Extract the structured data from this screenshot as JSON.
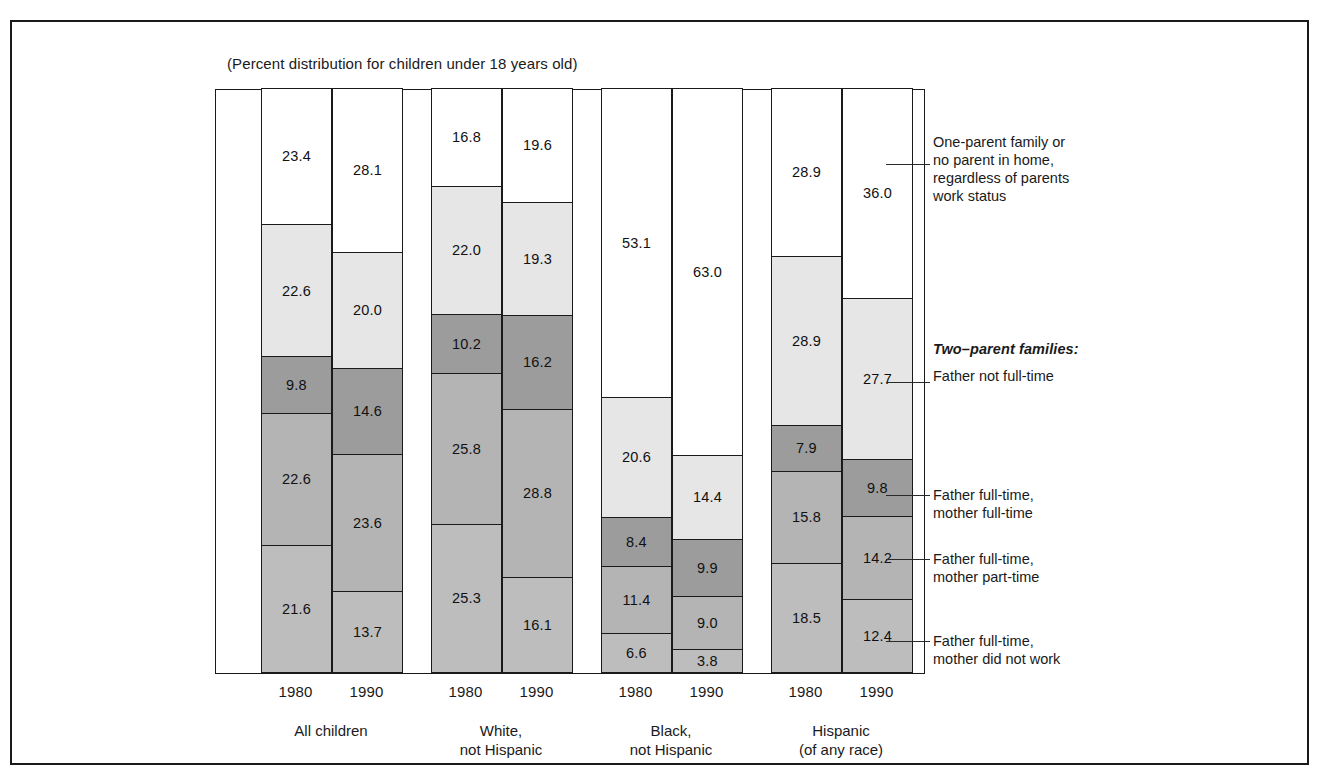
{
  "subtitle": "(Percent distribution for children under 18 years old)",
  "legend": {
    "heading": "Two–parent families:",
    "items": [
      {
        "name": "one-parent-or-no-parent",
        "label": "One-parent family or\nno parent in home,\nregardless of parents\nwork status"
      },
      {
        "name": "father-not-full-time",
        "label": "Father not full-time"
      },
      {
        "name": "father-ft-mother-ft",
        "label": "Father full-time,\nmother full-time"
      },
      {
        "name": "father-ft-mother-pt",
        "label": "Father full-time,\nmother part-time"
      },
      {
        "name": "father-ft-mother-none",
        "label": "Father full-time,\nmother did not work"
      }
    ]
  },
  "chart_data": {
    "type": "bar",
    "subtype": "stacked-column",
    "title": "",
    "subtitle": "(Percent distribution for children under 18 years old)",
    "xlabel": "",
    "ylabel": "",
    "ylim": [
      0,
      100
    ],
    "grid": false,
    "legend_position": "right",
    "categories": [
      "All children 1980",
      "All children 1990",
      "White, not Hispanic 1980",
      "White, not Hispanic 1990",
      "Black, not Hispanic 1980",
      "Black, not Hispanic 1990",
      "Hispanic (of any race) 1980",
      "Hispanic (of any race) 1990"
    ],
    "groups": [
      {
        "name": "All children",
        "lines": [
          "All children"
        ]
      },
      {
        "name": "White, not Hispanic",
        "lines": [
          "White,",
          "not Hispanic"
        ]
      },
      {
        "name": "Black, not Hispanic",
        "lines": [
          "Black,",
          "not Hispanic"
        ]
      },
      {
        "name": "Hispanic (of any race)",
        "lines": [
          "Hispanic",
          "(of any race)"
        ]
      }
    ],
    "years": [
      "1980",
      "1990"
    ],
    "series": [
      {
        "name": "One-parent family or no parent in home, regardless of parents work status",
        "shade": "#ffffff",
        "values": [
          23.4,
          28.1,
          16.8,
          19.6,
          53.1,
          63.0,
          28.9,
          36.0
        ]
      },
      {
        "name": "Father not full-time",
        "shade": "#e6e6e6",
        "values": [
          22.6,
          20.0,
          22.0,
          19.3,
          20.6,
          14.4,
          28.9,
          27.7
        ]
      },
      {
        "name": "Father full-time, mother full-time",
        "shade": "#9c9c9c",
        "values": [
          9.8,
          14.6,
          10.2,
          16.2,
          8.4,
          9.9,
          7.9,
          9.8
        ]
      },
      {
        "name": "Father full-time, mother part-time",
        "shade": "#b4b4b4",
        "values": [
          22.6,
          23.6,
          25.8,
          28.8,
          11.4,
          9.0,
          15.8,
          14.2
        ]
      },
      {
        "name": "Father full-time, mother did not work",
        "shade": "#bdbdbd",
        "values": [
          21.6,
          13.7,
          25.3,
          16.1,
          6.6,
          3.8,
          18.5,
          12.4
        ]
      }
    ]
  }
}
